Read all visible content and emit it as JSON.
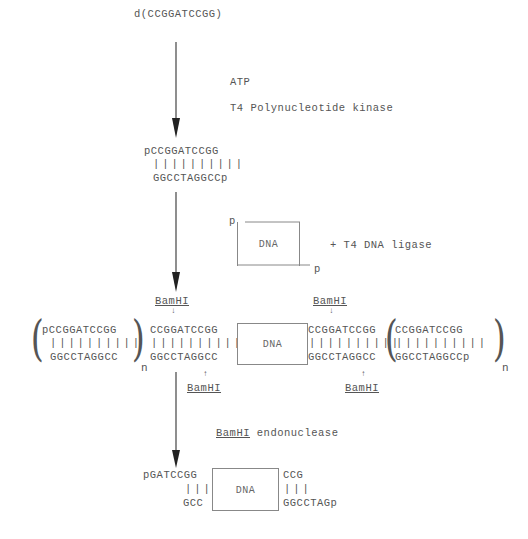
{
  "diagram": {
    "start_oligo": "d(CCGGATCCGG)",
    "step1": {
      "reagent1": "ATP",
      "reagent2": "T4 Polynucleotide kinase"
    },
    "phosphorylated_linker": {
      "top": "pCCGGATCCGG",
      "bonds": "||||||||||",
      "bottom": "GGCCTAGGCCp"
    },
    "step2": {
      "fragment_label": "DNA",
      "end_left": "p",
      "end_right": "p",
      "reagent": "+ T4 DNA ligase"
    },
    "ligated_product": {
      "left_repeat_top": "pCCGGATCCGG",
      "left_repeat_bonds": "||||||||||",
      "left_repeat_bottom": "GGCCTAGGCC",
      "left_linker_top": "CCGGATCCGG",
      "left_linker_bonds": "||||||||||",
      "left_linker_bottom": "GGCCTAGGCC",
      "fragment_label": "DNA",
      "right_linker_top": "CCGGATCCGG",
      "right_linker_bonds": "||||||||||",
      "right_linker_bottom": "GGCCTAGGCC",
      "right_repeat_top": "CCGGATCCGG",
      "right_repeat_bonds": "||||||||||",
      "right_repeat_bottom": "GGCCTAGGCCp",
      "repeat_subscript_left": "n",
      "repeat_subscript_right": "n",
      "site_label_top_left": "BamHI",
      "site_label_top_right": "BamHI",
      "site_label_bottom_left": "BamHI",
      "site_label_bottom_right": "BamHI",
      "cut_arrow_down": "↓",
      "cut_arrow_up": "↑"
    },
    "step3": {
      "enzyme": "BamHI",
      "reagent_suffix": " endonuclease"
    },
    "final_product": {
      "left_top": "pGATCCGG",
      "left_bonds": "|||",
      "left_bottom": "GCC",
      "fragment_label": "DNA",
      "right_top": "CCG",
      "right_bonds": "|||",
      "right_bottom": "GGCCTAGp"
    }
  }
}
